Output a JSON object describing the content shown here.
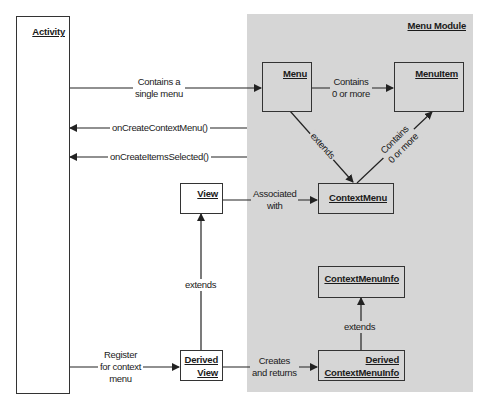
{
  "module": {
    "title": "Menu Module",
    "background": "#d6d6d6"
  },
  "nodes": {
    "activity": "Activity",
    "menu": "Menu",
    "menuitem": "MenuItem",
    "contextmenu": "ContextMenu",
    "view": "View",
    "derived_view_1": "Derived",
    "derived_view_2": "View",
    "contextmenuinfo": "ContextMenuInfo",
    "derived_cmi_1": "Derived",
    "derived_cmi_2": "ContextMenuInfo"
  },
  "edges": {
    "activity_menu_1": "Contains a",
    "activity_menu_2": "single menu",
    "menu_menuitem_1": "Contains",
    "menu_menuitem_2": "0 or more",
    "on_create_context_menu": "onCreateContextMenu()",
    "on_create_items_selected": "onCreateItemsSelected()",
    "menu_extends": "extends",
    "ctx_contains_1": "Contains",
    "ctx_contains_2": "0 or more",
    "view_assoc_1": "Associated",
    "view_assoc_2": "with",
    "derived_view_extends": "extends",
    "register_1": "Register",
    "register_2": "for context",
    "register_3": "menu",
    "creates_1": "Creates",
    "creates_2": "and returns",
    "cmi_extends": "extends"
  }
}
